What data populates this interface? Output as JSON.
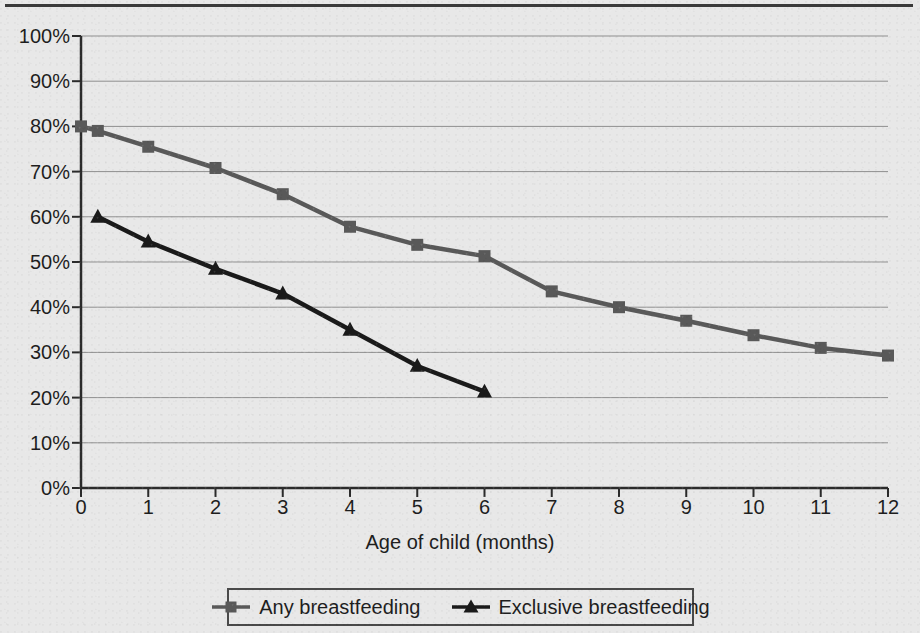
{
  "chart_data": {
    "type": "line",
    "title": "",
    "xlabel": "Age of child (months)",
    "ylabel": "",
    "xlim": [
      0,
      12
    ],
    "ylim": [
      0,
      100
    ],
    "grid": true,
    "legend_position": "bottom-center",
    "y_tick_labels": [
      "100%",
      "90%",
      "80%",
      "70%",
      "60%",
      "50%",
      "40%",
      "30%",
      "20%",
      "10%",
      "0%"
    ],
    "y_tick_values": [
      100,
      90,
      80,
      70,
      60,
      50,
      40,
      30,
      20,
      10,
      0
    ],
    "x_tick_labels": [
      "0",
      "1",
      "2",
      "3",
      "4",
      "5",
      "6",
      "7",
      "8",
      "9",
      "10",
      "11",
      "12"
    ],
    "x_tick_values": [
      0,
      1,
      2,
      3,
      4,
      5,
      6,
      7,
      8,
      9,
      10,
      11,
      12
    ],
    "series": [
      {
        "name": "Any breastfeeding",
        "color": "#595959",
        "marker": "square",
        "x": [
          0,
          0.25,
          1,
          2,
          3,
          4,
          5,
          6,
          7,
          8,
          9,
          10,
          11,
          12
        ],
        "values": [
          80.0,
          79.0,
          75.5,
          70.8,
          65.0,
          57.8,
          53.8,
          51.3,
          43.5,
          40.0,
          37.0,
          33.8,
          31.0,
          29.3
        ]
      },
      {
        "name": "Exclusive breastfeeding",
        "color": "#1a1a1a",
        "marker": "triangle",
        "x": [
          0.25,
          1,
          2,
          3,
          4,
          5,
          6
        ],
        "values": [
          60.0,
          54.5,
          48.5,
          43.0,
          35.0,
          27.0,
          21.3
        ]
      }
    ]
  },
  "legend": {
    "entries": [
      {
        "label": "Any breastfeeding",
        "marker": "square-marker-icon",
        "color": "#595959"
      },
      {
        "label": "Exclusive breastfeeding",
        "marker": "triangle-marker-icon",
        "color": "#1a1a1a"
      }
    ]
  },
  "colors": {
    "background": "#e8e8e8",
    "axis": "#2b2b2b",
    "gridline": "#8f8f8f",
    "any_breastfeeding": "#595959",
    "exclusive_breastfeeding": "#1a1a1a",
    "top_rule": "#3a3a3a"
  }
}
